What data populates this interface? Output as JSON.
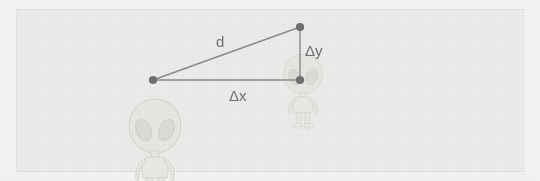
{
  "diagram": {
    "background_color": "#f3f3f2",
    "panel_color": "#ebebe9",
    "panel_border_color": "#e2e2e0",
    "line_color": "#8a8a8a",
    "vertex_color": "#6f6f6f",
    "label_color": "#6f6f6f",
    "character_color": "#dcdcd8",
    "labels": {
      "hypotenuse": "d",
      "horizontal_leg": "Δx",
      "vertical_leg": "Δy"
    },
    "vertices": [
      {
        "name": "point-a",
        "x": 153,
        "y": 80
      },
      {
        "name": "point-b",
        "x": 300,
        "y": 27
      },
      {
        "name": "corner",
        "x": 300,
        "y": 80
      }
    ],
    "segments": [
      {
        "name": "hypotenuse-d",
        "from": "point-a",
        "to": "point-b"
      },
      {
        "name": "horizontal-dx",
        "from": "point-a",
        "to": "corner"
      },
      {
        "name": "vertical-dy",
        "from": "corner",
        "to": "point-b"
      }
    ],
    "characters": [
      {
        "name": "alien-left",
        "cx": 155,
        "cy": 126,
        "scale": 1.0
      },
      {
        "name": "alien-right",
        "cx": 303,
        "cy": 74,
        "scale": 0.74
      }
    ]
  }
}
